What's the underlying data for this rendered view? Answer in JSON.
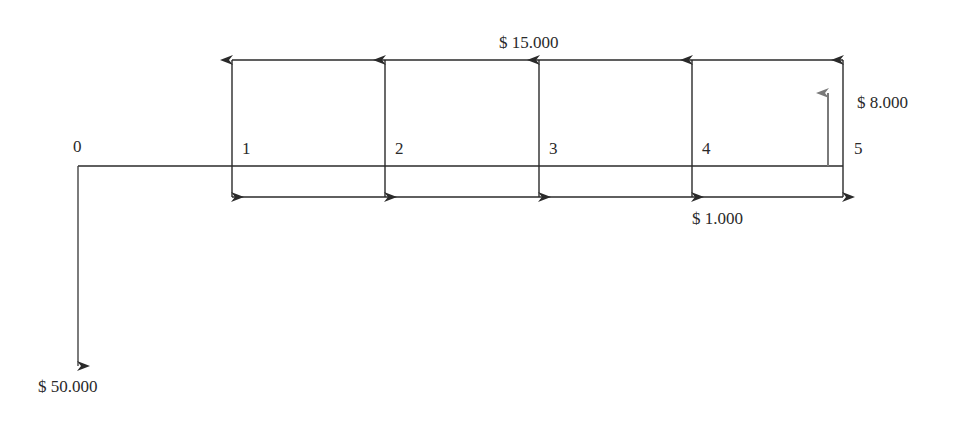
{
  "diagram": {
    "type": "cash-flow diagram",
    "periods": [
      "0",
      "1",
      "2",
      "3",
      "4",
      "5"
    ],
    "labels": {
      "income": "$ 15.000",
      "expense": "$ 1.000",
      "salvage": "$ 8.000",
      "investment": "$ 50.000"
    },
    "flows": [
      {
        "period": 0,
        "amount": -50000,
        "label": "$ 50.000",
        "direction": "down"
      },
      {
        "period": 1,
        "inflow": 15000,
        "outflow": 1000
      },
      {
        "period": 2,
        "inflow": 15000,
        "outflow": 1000
      },
      {
        "period": 3,
        "inflow": 15000,
        "outflow": 1000
      },
      {
        "period": 4,
        "inflow": 15000,
        "outflow": 1000
      },
      {
        "period": 5,
        "inflow": 15000,
        "outflow": 1000,
        "extra_inflow": 8000
      }
    ],
    "colors": {
      "line": "#2a2a2a",
      "salvage_arrow": "#7a7a7a"
    }
  }
}
